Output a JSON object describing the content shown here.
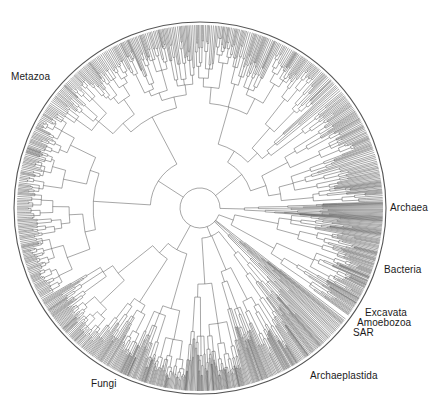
{
  "figure": {
    "type": "circular-phylogenetic-tree",
    "center": [
      200,
      208
    ],
    "inner_radius": 20,
    "outer_radius": 183,
    "outer_ring_radius": 186,
    "line_color": "#3a3a3a",
    "ring_color": "#555555"
  },
  "clades": [
    {
      "name": "Metazoa",
      "label_pos": [
        11,
        71
      ],
      "start_deg": 150,
      "end_deg": 268,
      "density": 1.0
    },
    {
      "name": "Archaea",
      "label_pos": [
        390,
        202
      ],
      "start_deg": 358,
      "end_deg": 364,
      "density": 1.6
    },
    {
      "name": "Bacteria",
      "label_pos": [
        384,
        264
      ],
      "start_deg": 4,
      "end_deg": 36,
      "density": 1.3
    },
    {
      "name": "Excavata",
      "label_pos": [
        365,
        307
      ],
      "start_deg": 37,
      "end_deg": 39,
      "density": 1.0
    },
    {
      "name": "Amoebozoa",
      "label_pos": [
        357,
        317
      ],
      "start_deg": 39,
      "end_deg": 41,
      "density": 1.0
    },
    {
      "name": "SAR",
      "label_pos": [
        353,
        327
      ],
      "start_deg": 41,
      "end_deg": 46,
      "density": 1.2
    },
    {
      "name": "Archaeplastida",
      "label_pos": [
        310,
        370
      ],
      "start_deg": 46,
      "end_deg": 95,
      "density": 1.4
    },
    {
      "name": "Fungi",
      "label_pos": [
        91,
        378
      ],
      "start_deg": 95,
      "end_deg": 150,
      "density": 1.3
    },
    {
      "name": "Metazoa-upper",
      "label_pos": null,
      "start_deg": 268,
      "end_deg": 358,
      "density": 1.0
    }
  ]
}
